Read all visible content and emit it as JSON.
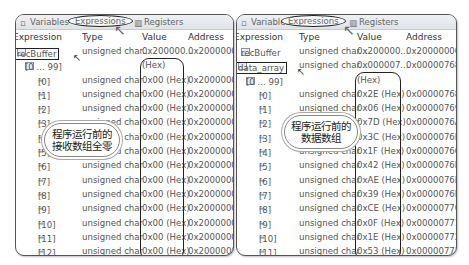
{
  "tabs": {
    "variables": "Variables",
    "expressions": "Expressions",
    "registers": "Registers"
  },
  "columns": {
    "expression": "Expression",
    "type": "Type",
    "value": "Value",
    "address": "Address"
  },
  "left_panel": {
    "root": {
      "name": "recBuffer",
      "type": "unsigned char...",
      "value": "0x200000...",
      "address": "0x20000000"
    },
    "range": {
      "name": "[0 ... 99]",
      "value": "(Hex)"
    },
    "rows": [
      {
        "index": "[0]",
        "type": "unsigned char",
        "value": "0x00 (Hex)",
        "address": "0x20000000"
      },
      {
        "index": "[1]",
        "type": "unsigned char",
        "value": "0x00 (Hex)",
        "address": "0x20000001"
      },
      {
        "index": "[2]",
        "type": "unsigned char",
        "value": "0x00 (Hex)",
        "address": "0x20000002"
      },
      {
        "index": "[3]",
        "type": "unsigned char",
        "value": "0x00 (Hex)",
        "address": "0x20000003"
      },
      {
        "index": "[4]",
        "type": "unsigned char",
        "value": "0x00 (Hex)",
        "address": "0x20000004"
      },
      {
        "index": "[5]",
        "type": "unsigned char",
        "value": "0x00 (Hex)",
        "address": "0x20000005"
      },
      {
        "index": "[6]",
        "type": "unsigned char",
        "value": "0x00 (Hex)",
        "address": "0x20000006"
      },
      {
        "index": "[7]",
        "type": "unsigned char",
        "value": "0x00 (Hex)",
        "address": "0x20000007"
      },
      {
        "index": "[8]",
        "type": "unsigned char",
        "value": "0x00 (Hex)",
        "address": "0x20000008"
      },
      {
        "index": "[9]",
        "type": "unsigned char",
        "value": "0x00 (Hex)",
        "address": "0x20000009"
      },
      {
        "index": "[10]",
        "type": "unsigned char",
        "value": "0x00 (Hex)",
        "address": "0x2000000A"
      },
      {
        "index": "[11]",
        "type": "unsigned char",
        "value": "0x00 (Hex)",
        "address": "0x2000000B"
      },
      {
        "index": "[12]",
        "type": "unsigned char",
        "value": "0x00 (Hex)",
        "address": "0x2000000C"
      },
      {
        "index": "[13]",
        "type": "unsigned char",
        "value": "0x00 (Hex)",
        "address": "0x2000000D"
      },
      {
        "index": "[14]",
        "type": "unsigned char",
        "value": "0x00 (Hex)",
        "address": "0x2000000E"
      },
      {
        "index": "[15]",
        "type": "unsigned char",
        "value": "0x00 (Hex)",
        "address": "0x2000000F"
      }
    ],
    "callout": [
      "程序运行前的",
      "接收数组全零"
    ]
  },
  "right_panel": {
    "root": {
      "name": "recBuffer",
      "type": "unsigned char...",
      "value": "0x200000...",
      "address": "0x20000000"
    },
    "selected": {
      "name": "data_array",
      "type": "unsigned char...",
      "value": "0x000007...",
      "address": "0x00000768"
    },
    "range": {
      "name": "[0 ... 99]",
      "value": "(Hex)"
    },
    "rows": [
      {
        "index": "[0]",
        "type": "unsigned char",
        "value": "0x2E (Hex)",
        "address": "0x00000768"
      },
      {
        "index": "[1]",
        "type": "unsigned char",
        "value": "0x06 (Hex)",
        "address": "0x00000769"
      },
      {
        "index": "[2]",
        "type": "unsigned char",
        "value": "0x7D (Hex)",
        "address": "0x0000076A"
      },
      {
        "index": "[3]",
        "type": "unsigned char",
        "value": "0x3C (Hex)",
        "address": "0x0000076B"
      },
      {
        "index": "[4]",
        "type": "unsigned char",
        "value": "0x1F (Hex)",
        "address": "0x0000076C"
      },
      {
        "index": "[5]",
        "type": "unsigned char",
        "value": "0x42 (Hex)",
        "address": "0x0000076D"
      },
      {
        "index": "[6]",
        "type": "unsigned char",
        "value": "0xAE (Hex)",
        "address": "0x0000076E"
      },
      {
        "index": "[7]",
        "type": "unsigned char",
        "value": "0x39 (Hex)",
        "address": "0x0000076F"
      },
      {
        "index": "[8]",
        "type": "unsigned char",
        "value": "0xCE (Hex)",
        "address": "0x00000770"
      },
      {
        "index": "[9]",
        "type": "unsigned char",
        "value": "0x0F (Hex)",
        "address": "0x00000771"
      },
      {
        "index": "[10]",
        "type": "unsigned char",
        "value": "0x1E (Hex)",
        "address": "0x00000772"
      },
      {
        "index": "[11]",
        "type": "unsigned char",
        "value": "0x53 (Hex)",
        "address": "0x00000773"
      },
      {
        "index": "[12]",
        "type": "unsigned char",
        "value": "0x82 (Hex)",
        "address": "0x00000774"
      },
      {
        "index": "[13]",
        "type": "unsigned char",
        "value": "0x4E (Hex)",
        "address": "0x00000775"
      },
      {
        "index": "[14]",
        "type": "unsigned char",
        "value": "0xAE (Hex)",
        "address": "0x00000776"
      }
    ],
    "callout": [
      "程序运行前的",
      "数据数组"
    ]
  },
  "icons": {
    "expand": "▾",
    "element": "⇛",
    "arrow": "↖",
    "cursor": "↖"
  }
}
